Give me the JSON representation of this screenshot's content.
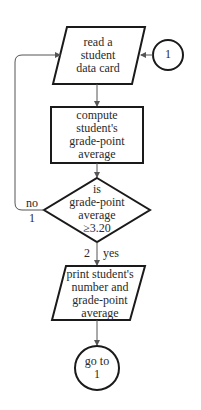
{
  "diagram": {
    "type": "flowchart",
    "colors": {
      "stroke": "#1a1a1a",
      "connector": "#555555",
      "text": "#2a2a2a",
      "background": "#ffffff"
    },
    "nodes": {
      "connector_start": {
        "shape": "circle",
        "label": "1"
      },
      "read_card": {
        "shape": "parallelogram",
        "lines": [
          "read a",
          "student",
          "data card"
        ]
      },
      "compute": {
        "shape": "rectangle",
        "lines": [
          "compute",
          "student's",
          "grade-point",
          "average"
        ]
      },
      "decision": {
        "shape": "diamond",
        "lines": [
          "is",
          "grade-point",
          "average",
          "≥3.20"
        ]
      },
      "print": {
        "shape": "parallelogram",
        "lines": [
          "print student's",
          "number and",
          "grade-point",
          "average"
        ]
      },
      "connector_end": {
        "shape": "circle",
        "lines": [
          "go to",
          "1"
        ]
      }
    },
    "edges": {
      "no": {
        "label": "no",
        "number": "1"
      },
      "yes": {
        "label": "yes",
        "number": "2"
      }
    }
  }
}
